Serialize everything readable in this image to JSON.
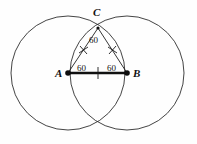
{
  "figure": {
    "kind": "geometric-construction",
    "background_color": "#fefefe",
    "stroke_color": "#2a2a2a",
    "points": [
      {
        "name": "A",
        "label": "A",
        "x": 68,
        "y": 73
      },
      {
        "name": "B",
        "label": "B",
        "x": 127,
        "y": 73
      },
      {
        "name": "C",
        "label": "C",
        "x": 98,
        "y": 28
      }
    ],
    "angle_labels": [
      {
        "at": "C",
        "text": "60"
      },
      {
        "at": "A",
        "text": "60"
      },
      {
        "at": "B",
        "text": "60"
      }
    ],
    "circles": [
      {
        "name": "circle-centered-at-A",
        "cx": 68,
        "cy": 73,
        "r": 57
      },
      {
        "name": "circle-centered-at-B",
        "cx": 127,
        "cy": 73,
        "r": 57
      }
    ],
    "segments": [
      {
        "name": "segment-AB",
        "from": "A",
        "to": "B",
        "emphasis": "thick"
      },
      {
        "name": "segment-AC",
        "from": "A",
        "to": "C",
        "emphasis": "thin"
      },
      {
        "name": "segment-BC",
        "from": "B",
        "to": "C",
        "emphasis": "thin"
      }
    ],
    "congruence_marks": [
      {
        "name": "tick-on-AB",
        "style": "single-vertical"
      },
      {
        "name": "tick-on-AC",
        "style": "cross"
      },
      {
        "name": "tick-on-BC",
        "style": "cross"
      }
    ]
  }
}
